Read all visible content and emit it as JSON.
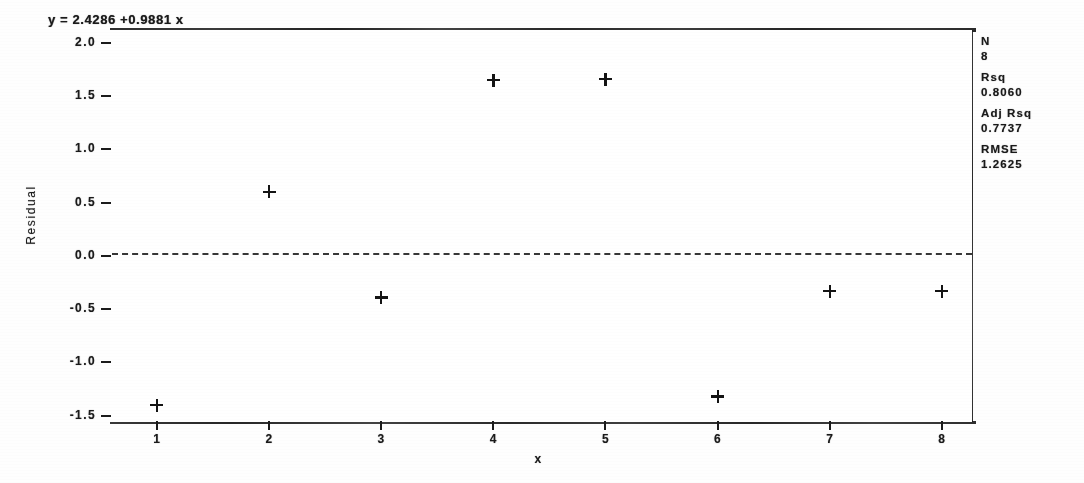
{
  "equation": "y = 2.4286 +0.9881 x",
  "axes": {
    "ytitle": "Residual",
    "xtitle": "x",
    "yticks": [
      "2.0",
      "1.5",
      "1.0",
      "0.5",
      "0.0",
      "-0.5",
      "-1.0",
      "-1.5"
    ],
    "xticks": [
      "1",
      "2",
      "3",
      "4",
      "5",
      "6",
      "7",
      "8"
    ]
  },
  "stats": {
    "n_label": "N",
    "n_value": "8",
    "rsq_label": "Rsq",
    "rsq_value": "0.8060",
    "adjrsq_label": "Adj Rsq",
    "adjrsq_value": "0.7737",
    "rmse_label": "RMSE",
    "rmse_value": "1.2625"
  },
  "chart_data": {
    "type": "scatter",
    "title": "y = 2.4286 +0.9881 x",
    "xlabel": "x",
    "ylabel": "Residual",
    "x": [
      1,
      2,
      3,
      4,
      5,
      6,
      7,
      8
    ],
    "values": [
      -1.4,
      0.6,
      -0.39,
      1.65,
      1.66,
      -1.32,
      -0.33,
      -0.33
    ],
    "xlim": [
      0.6,
      8.25
    ],
    "ylim": [
      -1.55,
      2.12
    ],
    "grid": false,
    "legend": false,
    "marker": "plus",
    "reference_line": {
      "orientation": "horizontal",
      "y": 0.03,
      "style": "dashed"
    },
    "annotations": [
      "N 8",
      "Rsq 0.8060",
      "Adj Rsq 0.7737",
      "RMSE 1.2625"
    ]
  }
}
